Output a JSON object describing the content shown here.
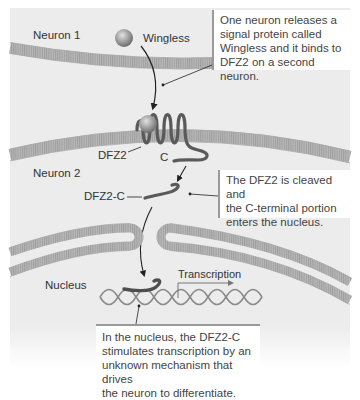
{
  "labels": {
    "neuron1": "Neuron 1",
    "wingless": "Wingless",
    "dfz2": "DFZ2",
    "c": "C",
    "neuron2": "Neuron 2",
    "dfz2c": "DFZ2-C",
    "nucleus": "Nucleus",
    "transcription": "Transcription"
  },
  "callouts": {
    "step1": {
      "lines": [
        "One neuron releases a",
        "signal protein called",
        "Wingless and it binds to",
        "DFZ2 on a second neuron."
      ]
    },
    "step2": {
      "lines": [
        "The DFZ2 is cleaved and",
        "the C-terminal portion",
        "enters the nucleus."
      ]
    },
    "step3": {
      "lines": [
        "In the nucleus, the DFZ2-C",
        "stimulates transcription by an",
        "unknown mechanism that drives",
        "the neuron to differentiate."
      ]
    }
  },
  "colors": {
    "background": "#ececec",
    "membrane": "#b4b4b4",
    "membrane_stripe": "#9c9c9c",
    "receptor": "#555555",
    "ligand": "#9a9a9a",
    "dna": "#8a8a8a",
    "callout_rule": "#9a9a9a"
  }
}
